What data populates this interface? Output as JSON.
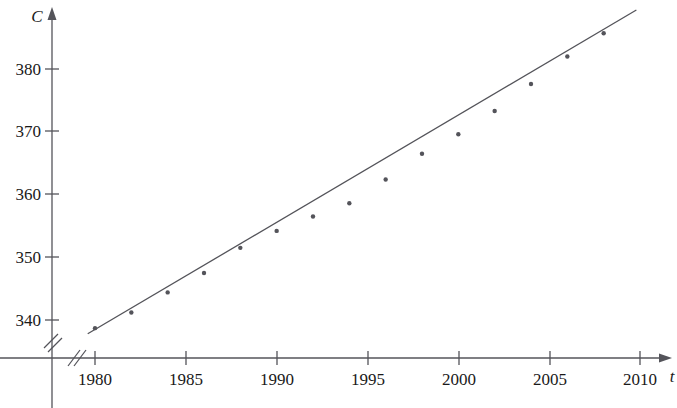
{
  "chart_data": {
    "type": "scatter",
    "title": "",
    "subtitle": "",
    "xlabel": "t",
    "ylabel": "C",
    "xlim": [
      1978.5,
      2011.5
    ],
    "ylim": [
      336.0,
      391.0
    ],
    "grid": false,
    "legend": null,
    "x_ticks": [
      1980,
      1985,
      1990,
      1995,
      2000,
      2005,
      2010
    ],
    "x_tick_labels": [
      "1980",
      "1985",
      "1990",
      "1995",
      "2000",
      "2005",
      "2010"
    ],
    "y_ticks": [
      340,
      350,
      360,
      370,
      380
    ],
    "y_tick_labels": [
      "340",
      "350",
      "360",
      "370",
      "380"
    ],
    "axis_break_x": true,
    "axis_break_y": true,
    "x": [
      1980,
      1982,
      1984,
      1986,
      1988,
      1990,
      1992,
      1994,
      1996,
      1998,
      2000,
      2002,
      2004,
      2006,
      2008
    ],
    "values": [
      338.7,
      341.2,
      344.4,
      347.5,
      351.5,
      354.2,
      356.5,
      358.6,
      362.4,
      366.5,
      369.6,
      373.3,
      377.6,
      382.0,
      385.7
    ],
    "series": [
      {
        "name": "CO2 level",
        "x": [
          1980,
          1982,
          1984,
          1986,
          1988,
          1990,
          1992,
          1994,
          1996,
          1998,
          2000,
          2002,
          2004,
          2006,
          2008
        ],
        "values": [
          338.7,
          341.2,
          344.4,
          347.5,
          351.5,
          354.2,
          356.5,
          358.6,
          362.4,
          366.5,
          369.6,
          373.3,
          377.6,
          382.0,
          385.7
        ],
        "marker": "dot",
        "color": "#54545a"
      },
      {
        "name": "regression line",
        "type": "line",
        "x": [
          1979.6,
          2009.8
        ],
        "values": [
          337.8,
          389.4
        ],
        "color": "#54545a"
      }
    ],
    "annotations": [],
    "colors": {
      "point": "#54545a",
      "line": "#54545a",
      "axis": "#54545a",
      "text": "#1a1a1a",
      "background": "#ffffff"
    }
  }
}
